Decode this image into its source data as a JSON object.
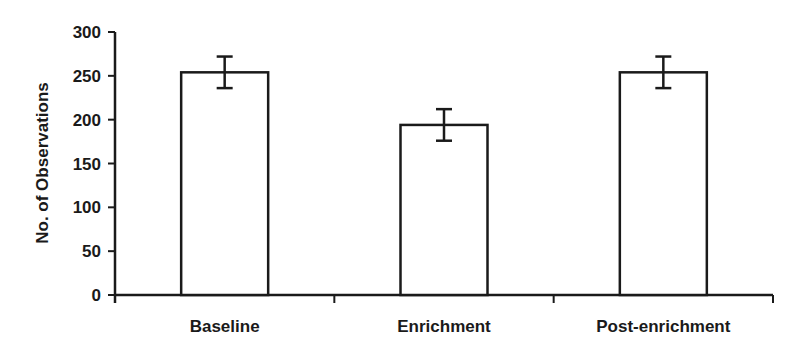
{
  "chart_data": {
    "type": "bar",
    "title": "",
    "xlabel": "",
    "ylabel": "No. of Observations",
    "categories": [
      "Baseline",
      "Enrichment",
      "Post-enrichment"
    ],
    "values": [
      254,
      194,
      254
    ],
    "error": [
      18,
      18,
      18
    ],
    "ylim": [
      0,
      300
    ],
    "yticks": [
      0,
      50,
      100,
      150,
      200,
      250,
      300
    ],
    "grid": false,
    "legend": null,
    "bar_fill": "#ffffff",
    "bar_stroke": "#1a1a1a"
  }
}
